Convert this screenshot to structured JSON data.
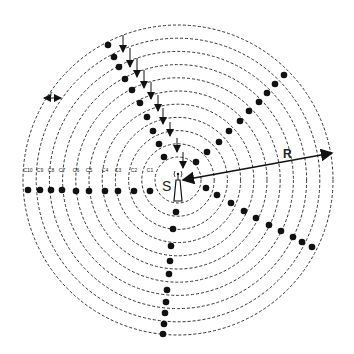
{
  "diagram": {
    "center": {
      "x": 178,
      "y": 180
    },
    "rings": {
      "count": 11,
      "inner_radius": 23,
      "spacing": 13.2,
      "color": "#333333"
    },
    "source_label": "S",
    "radius_label": "R",
    "spacing_label": "r",
    "ring_labels": [
      "C10",
      "C9",
      "C8",
      "C7",
      "C6",
      "C5",
      "C4",
      "C3",
      "C2",
      "C1"
    ],
    "ring_label_x": [
      28,
      40,
      51,
      62,
      76,
      89,
      105,
      118,
      134,
      150
    ],
    "dot_color": "#111111",
    "branches": {
      "left": [
        [
          28,
          190
        ],
        [
          40,
          190
        ],
        [
          51,
          190
        ],
        [
          62,
          190
        ],
        [
          76,
          191
        ],
        [
          89,
          191
        ],
        [
          105,
          191
        ],
        [
          118,
          191
        ],
        [
          134,
          191
        ],
        [
          150,
          191
        ]
      ],
      "upper_left": [
        [
          108,
          45
        ],
        [
          114,
          57
        ],
        [
          119,
          67
        ],
        [
          125,
          79
        ],
        [
          132,
          90
        ],
        [
          140,
          103
        ],
        [
          147,
          117
        ],
        [
          153,
          131
        ],
        [
          159,
          144
        ],
        [
          164,
          157
        ]
      ],
      "upper_right": [
        [
          196,
          162
        ],
        [
          207,
          152
        ],
        [
          219,
          142
        ],
        [
          229,
          131
        ],
        [
          240,
          121
        ],
        [
          249,
          111
        ],
        [
          259,
          102
        ],
        [
          267,
          93
        ],
        [
          275,
          84
        ],
        [
          284,
          75
        ]
      ],
      "lower_right": [
        [
          206,
          188
        ],
        [
          217,
          195
        ],
        [
          231,
          203
        ],
        [
          244,
          211
        ],
        [
          256,
          218
        ],
        [
          269,
          225
        ],
        [
          281,
          231
        ],
        [
          293,
          237
        ],
        [
          302,
          242
        ],
        [
          312,
          247
        ]
      ],
      "bottom": [
        [
          176,
          212
        ],
        [
          173,
          229
        ],
        [
          171,
          246
        ],
        [
          170,
          261
        ],
        [
          169,
          274
        ],
        [
          167,
          290
        ],
        [
          166,
          302
        ],
        [
          165,
          313
        ],
        [
          164,
          324
        ],
        [
          163,
          334
        ]
      ]
    },
    "down_arrows": [
      [
        123,
        35,
        52
      ],
      [
        130,
        48,
        67
      ],
      [
        137,
        58,
        77
      ],
      [
        144,
        70,
        88
      ],
      [
        151,
        82,
        99
      ],
      [
        158,
        95,
        111
      ],
      [
        163,
        108,
        124
      ],
      [
        170,
        122,
        136
      ],
      [
        177,
        138,
        152
      ],
      [
        183,
        152,
        168
      ]
    ],
    "radius_arrow": {
      "x1": 183,
      "y1": 180,
      "x2": 332,
      "y2": 153
    }
  }
}
